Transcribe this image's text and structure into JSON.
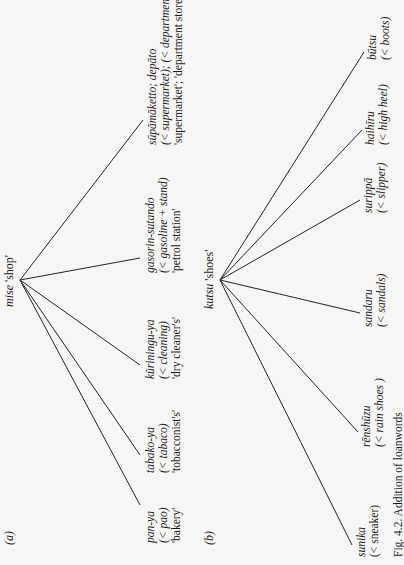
{
  "panels": [
    {
      "label": "(a)",
      "root": {
        "word": "mise",
        "gloss": "'shop'"
      },
      "children": [
        {
          "word": "pan-ya",
          "source": "(< pao)",
          "gloss": "'bakery'"
        },
        {
          "word": "tabako-ya",
          "source": "(< tabaco)",
          "gloss": "'tobacconist's'"
        },
        {
          "word": "kūriningu-ya",
          "source": "(< cleaning)",
          "gloss": "'dry cleaner's'"
        },
        {
          "word": "gasorin-sutando",
          "source": "(< gasoline + stand)",
          "gloss": "'petrol station'"
        },
        {
          "word": "sūpāmāketto; depāto",
          "source": "(< supermarket); (< department)",
          "gloss": "'supermarket'; 'department store'"
        }
      ]
    },
    {
      "label": "(b)",
      "root": {
        "word": "kutsu",
        "gloss": "'shoes'"
      },
      "children": [
        {
          "word": "sunika",
          "source": "(< sneaker)"
        },
        {
          "word": "rēnshūzu",
          "source": "(< rain shoes )"
        },
        {
          "word": "sandaru",
          "source": "(< sandals)"
        },
        {
          "word": "surippā",
          "source": "(< slipper)"
        },
        {
          "word": "haihīru",
          "source": "(< high heel)"
        },
        {
          "word": "būtsu",
          "source": "(< boots)"
        }
      ]
    }
  ],
  "caption": "Fig. 4.2. Addition of loanwords"
}
